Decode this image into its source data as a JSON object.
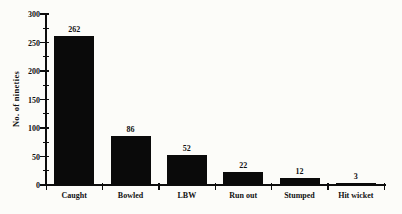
{
  "chart_data": {
    "type": "bar",
    "categories": [
      "Caught",
      "Bowled",
      "LBW",
      "Run out",
      "Stumped",
      "Hit wicket"
    ],
    "values": [
      262,
      86,
      52,
      22,
      12,
      3
    ],
    "title": "",
    "xlabel": "",
    "ylabel": "No. of nineties",
    "ylim": [
      0,
      300
    ],
    "yticks": [
      0,
      50,
      100,
      150,
      200,
      250,
      300
    ],
    "y_minor_step": 25,
    "grid": false,
    "legend": null,
    "bar_color": "#0a0a0a",
    "background": "#fcfcf9",
    "text_color": "#111111"
  }
}
